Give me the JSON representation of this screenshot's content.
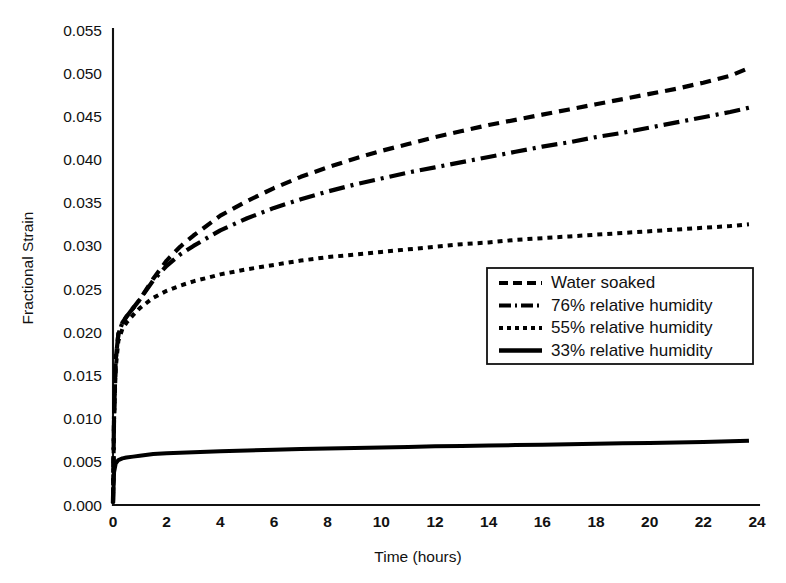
{
  "chart_data": {
    "type": "line",
    "title": "",
    "xlabel": "Time  (hours)",
    "ylabel": "Fractional Strain",
    "xlim": [
      0,
      24
    ],
    "ylim": [
      0.0,
      0.055
    ],
    "xticks": [
      "0",
      "2",
      "4",
      "6",
      "8",
      "10",
      "12",
      "14",
      "16",
      "18",
      "20",
      "22",
      "24"
    ],
    "xtick_values": [
      0,
      2,
      4,
      6,
      8,
      10,
      12,
      14,
      16,
      18,
      20,
      22,
      24
    ],
    "yticks": [
      "0.000",
      "0.005",
      "0.010",
      "0.015",
      "0.020",
      "0.025",
      "0.030",
      "0.035",
      "0.040",
      "0.045",
      "0.050",
      "0.055"
    ],
    "ytick_values": [
      0.0,
      0.005,
      0.01,
      0.015,
      0.02,
      0.025,
      0.03,
      0.035,
      0.04,
      0.045,
      0.05,
      0.055
    ],
    "grid": false,
    "legend_position": "center-right",
    "x_label_note": "Time in hours, 0 to 24",
    "series": [
      {
        "name": "Water soaked",
        "style": "dashed",
        "dash": "11,7",
        "width": 4.2,
        "color": "#000000",
        "x": [
          0,
          0.04,
          0.1,
          0.2,
          0.35,
          0.5,
          0.75,
          1.0,
          1.5,
          2.0,
          2.5,
          3.0,
          4.0,
          5.0,
          6.0,
          7.0,
          8.0,
          9.0,
          10.0,
          11.0,
          12.0,
          13.0,
          14.0,
          15.0,
          16.0,
          17.0,
          18.0,
          19.0,
          20.0,
          21.0,
          22.0,
          23.0,
          23.7
        ],
        "y": [
          0.0002,
          0.0105,
          0.0168,
          0.0198,
          0.0211,
          0.0218,
          0.0228,
          0.0238,
          0.0262,
          0.0283,
          0.0299,
          0.0312,
          0.0335,
          0.0352,
          0.0367,
          0.038,
          0.0391,
          0.0401,
          0.041,
          0.0418,
          0.0426,
          0.0433,
          0.044,
          0.0446,
          0.0452,
          0.0458,
          0.0464,
          0.047,
          0.0476,
          0.0482,
          0.0489,
          0.0497,
          0.0506
        ]
      },
      {
        "name": "76% relative humidity",
        "style": "dash-dot",
        "dash": "16,6,3,6",
        "width": 4.2,
        "color": "#000000",
        "x": [
          0,
          0.04,
          0.1,
          0.2,
          0.35,
          0.5,
          0.75,
          1.0,
          1.5,
          2.0,
          2.5,
          3.0,
          4.0,
          5.0,
          6.0,
          7.0,
          8.0,
          9.0,
          10.0,
          11.0,
          12.0,
          13.0,
          14.0,
          15.0,
          16.0,
          17.0,
          18.0,
          19.0,
          20.0,
          21.0,
          22.0,
          23.0,
          23.7
        ],
        "y": [
          0.0002,
          0.0105,
          0.0168,
          0.0198,
          0.0211,
          0.0218,
          0.0228,
          0.0238,
          0.026,
          0.0277,
          0.029,
          0.03,
          0.0318,
          0.0332,
          0.0344,
          0.0354,
          0.0363,
          0.0371,
          0.0378,
          0.0385,
          0.0391,
          0.0397,
          0.0403,
          0.0409,
          0.0415,
          0.042,
          0.0426,
          0.0431,
          0.0437,
          0.0443,
          0.0449,
          0.0455,
          0.046
        ]
      },
      {
        "name": "55% relative humidity",
        "style": "dotted",
        "dash": "5,5",
        "width": 4.0,
        "color": "#000000",
        "x": [
          0,
          0.04,
          0.1,
          0.2,
          0.35,
          0.5,
          0.75,
          1.0,
          1.5,
          2.0,
          2.5,
          3.0,
          4.0,
          5.0,
          6.0,
          7.0,
          8.0,
          9.0,
          10.0,
          11.0,
          12.0,
          13.0,
          14.0,
          15.0,
          16.0,
          17.0,
          18.0,
          19.0,
          20.0,
          21.0,
          22.0,
          23.0,
          23.7
        ],
        "y": [
          0.0002,
          0.0098,
          0.0158,
          0.019,
          0.0204,
          0.0211,
          0.022,
          0.0228,
          0.024,
          0.0248,
          0.0254,
          0.0259,
          0.0267,
          0.0273,
          0.0278,
          0.0283,
          0.0287,
          0.029,
          0.0293,
          0.0296,
          0.0299,
          0.0302,
          0.0304,
          0.0307,
          0.0309,
          0.0311,
          0.0313,
          0.0315,
          0.0317,
          0.0319,
          0.0321,
          0.0323,
          0.0325
        ]
      },
      {
        "name": "33% relative humidity",
        "style": "solid",
        "dash": "none",
        "width": 4.0,
        "color": "#000000",
        "x": [
          0,
          0.04,
          0.1,
          0.2,
          0.35,
          0.5,
          0.75,
          1.0,
          1.5,
          2.0,
          2.5,
          3.0,
          4.0,
          5.0,
          6.0,
          7.0,
          8.0,
          9.0,
          10.0,
          11.0,
          12.0,
          13.0,
          14.0,
          15.0,
          16.0,
          17.0,
          18.0,
          19.0,
          20.0,
          21.0,
          22.0,
          23.0,
          23.7
        ],
        "y": [
          0.0002,
          0.0038,
          0.0048,
          0.0052,
          0.0054,
          0.0055,
          0.0056,
          0.0057,
          0.0059,
          0.006,
          0.00605,
          0.0061,
          0.00622,
          0.00632,
          0.0064,
          0.00648,
          0.00655,
          0.00661,
          0.00667,
          0.00673,
          0.00679,
          0.00684,
          0.00689,
          0.00694,
          0.00699,
          0.00704,
          0.00709,
          0.00714,
          0.00719,
          0.00724,
          0.0073,
          0.00737,
          0.00745
        ]
      }
    ]
  },
  "legend": {
    "entries": [
      {
        "label": "Water soaked",
        "style": "dashed"
      },
      {
        "label": "76% relative humidity",
        "style": "dash-dot"
      },
      {
        "label": "55% relative humidity",
        "style": "dotted"
      },
      {
        "label": "33% relative humidity",
        "style": "solid"
      }
    ]
  },
  "colors": {
    "ink": "#111111",
    "background": "#ffffff"
  }
}
